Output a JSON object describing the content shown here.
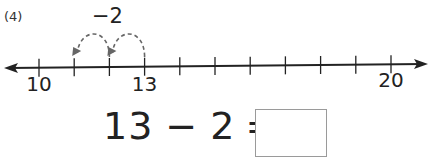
{
  "problem": {
    "number_label": "(4)",
    "jump_label": "−2"
  },
  "number_line": {
    "start": 10,
    "end": 20,
    "step": 1,
    "labeled_ticks": [
      {
        "value": 10,
        "label": "10"
      },
      {
        "value": 13,
        "label": "13"
      },
      {
        "value": 20,
        "label": "20"
      }
    ],
    "jumps": [
      {
        "from": 13,
        "to": 12
      },
      {
        "from": 12,
        "to": 11
      }
    ],
    "arrows": "both-ends",
    "line_color": "#222222",
    "jump_color": "#666666"
  },
  "equation": {
    "left_operand": "13",
    "operator": "−",
    "right_operand": "2",
    "equals": "=",
    "answer": ""
  }
}
